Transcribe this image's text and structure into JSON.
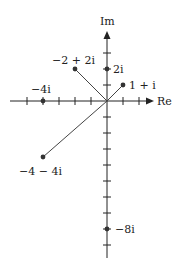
{
  "diagram": {
    "axes": {
      "real_label": "Re",
      "imag_label": "Im"
    },
    "origin_px": [
      107,
      101
    ],
    "unit_px": 16,
    "real_ticks": [
      -5,
      -4,
      -3,
      -2,
      -1,
      1,
      2
    ],
    "imag_ticks": [
      3,
      2,
      1,
      -1,
      -2,
      -3,
      -4,
      -5,
      -6,
      -7,
      -8,
      -9
    ],
    "points": [
      {
        "id": "p1",
        "re": 1,
        "im": 1,
        "label": "1 + i",
        "vector": true
      },
      {
        "id": "p2",
        "re": -2,
        "im": 2,
        "label": "−2 + 2i",
        "vector": true
      },
      {
        "id": "p3",
        "re": -4,
        "im": -4,
        "label": "−4 − 4i",
        "vector": true
      },
      {
        "id": "p4",
        "re": 0,
        "im": 2,
        "label": "2i",
        "vector": false
      },
      {
        "id": "p5",
        "re": -4,
        "im": 0,
        "label": "−4i",
        "vector": false
      },
      {
        "id": "p6",
        "re": 0,
        "im": -8,
        "label": "−8i",
        "vector": false
      }
    ],
    "colors": {
      "axis": "#222222",
      "vector": "#444444",
      "point": "#333333"
    }
  },
  "labels": {
    "re": "Re",
    "im": "Im",
    "p1": "1 + i",
    "p2": "−2 + 2i",
    "p3": "−4 − 4i",
    "p4": "2i",
    "p5": "−4i",
    "p6": "−8i"
  }
}
